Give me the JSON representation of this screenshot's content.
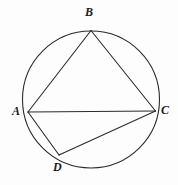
{
  "figure": {
    "background_color": "#fdfdfd",
    "stroke_color": "#2b2b2b",
    "circle": {
      "name": "circumscribed-circle",
      "cx": 91,
      "cy": 99.5,
      "r": 68.5,
      "stroke_width": 1.1
    },
    "points": [
      {
        "id": "A",
        "label": "A",
        "x": 28,
        "y": 112
      },
      {
        "id": "B",
        "label": "B",
        "x": 91,
        "y": 30.5
      },
      {
        "id": "C",
        "label": "C",
        "x": 155.5,
        "y": 111
      },
      {
        "id": "D",
        "label": "D",
        "x": 59,
        "y": 155
      }
    ],
    "segments": [
      {
        "id": "AB",
        "from": "A",
        "to": "B",
        "x1": 28,
        "y1": 112,
        "x2": 91,
        "y2": 30.5
      },
      {
        "id": "BC",
        "from": "B",
        "to": "C",
        "x1": 91,
        "y1": 30.5,
        "x2": 155.5,
        "y2": 111
      },
      {
        "id": "AD",
        "from": "A",
        "to": "D",
        "x1": 28,
        "y1": 112,
        "x2": 59,
        "y2": 155
      },
      {
        "id": "AC",
        "from": "A",
        "to": "C",
        "x1": 28,
        "y1": 112,
        "x2": 155.5,
        "y2": 111
      },
      {
        "id": "DC",
        "from": "D",
        "to": "C",
        "x1": 59,
        "y1": 155,
        "x2": 155.5,
        "y2": 111
      }
    ],
    "labels": {
      "A": "A",
      "B": "B",
      "C": "C",
      "D": "D"
    }
  }
}
